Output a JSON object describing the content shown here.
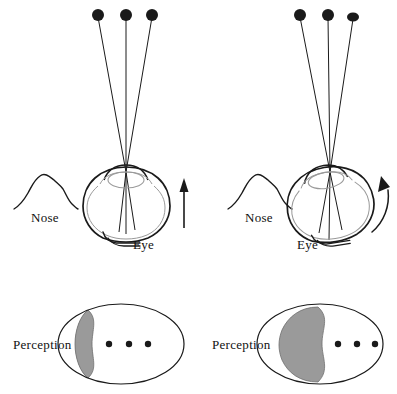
{
  "figure": {
    "background_color": "#ffffff",
    "stroke_color": "#1a1a1a",
    "inner_stroke_color": "#9a9a9a",
    "shaded_color": "#9a9a9a",
    "dot_color": "#1a1a1a",
    "width": 397,
    "height": 394
  },
  "panels": [
    {
      "id": "left",
      "condition_label": "straight-arrow",
      "nose_label": "Nose",
      "eye_label": "Eye",
      "perception_label": "Perception",
      "arrow_type": "straight-up-arrow",
      "stimulus_dots": [
        {
          "cx": 98,
          "cy": 15,
          "r": 6
        },
        {
          "cx": 126,
          "cy": 15,
          "r": 6
        },
        {
          "cx": 152,
          "cy": 15,
          "r": 6
        }
      ],
      "perception_dots": [
        {
          "cx": 109,
          "cy": 344,
          "r": 3.2
        },
        {
          "cx": 129,
          "cy": 344,
          "r": 3.2
        },
        {
          "cx": 148,
          "cy": 344,
          "r": 3.2
        }
      ],
      "shaded_fraction": "small"
    },
    {
      "id": "right",
      "condition_label": "curved-arrow",
      "nose_label": "Nose",
      "eye_label": "Eye",
      "perception_label": "Perception",
      "arrow_type": "curved-rotation-arrow",
      "stimulus_dots": [
        {
          "cx": 300,
          "cy": 15,
          "r": 6
        },
        {
          "cx": 328,
          "cy": 15,
          "r": 6
        },
        {
          "cx": 353,
          "cy": 17,
          "r": 6
        }
      ],
      "perception_dots": [
        {
          "cx": 338,
          "cy": 344,
          "r": 3.2
        },
        {
          "cx": 357,
          "cy": 344,
          "r": 3.2
        },
        {
          "cx": 375,
          "cy": 344,
          "r": 3.2
        }
      ],
      "shaded_fraction": "large"
    }
  ],
  "labels": {
    "nose_left": "Nose",
    "nose_right": "Nose",
    "eye_left": "Eye",
    "eye_right": "Eye",
    "perception_left": "Perception",
    "perception_right": "Perception"
  }
}
